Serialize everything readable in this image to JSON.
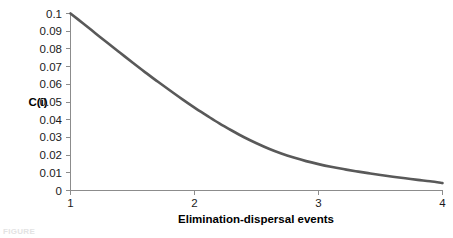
{
  "chart_data": {
    "type": "line",
    "title": "",
    "subtitle": "",
    "xlabel": "Elimination-dispersal events",
    "ylabel": "C(i)",
    "xlim": [
      1,
      4
    ],
    "ylim": [
      0,
      0.1
    ],
    "grid": false,
    "legend": null,
    "legend_position": "none",
    "xticks": [
      "1",
      "2",
      "3",
      "4"
    ],
    "xtick_values": [
      1,
      2,
      3,
      4
    ],
    "yticks": [
      "0",
      "0.01",
      "0.02",
      "0.03",
      "0.04",
      "0.05",
      "0.06",
      "0.07",
      "0.08",
      "0.09",
      "0.1"
    ],
    "ytick_values": [
      0,
      0.01,
      0.02,
      0.03,
      0.04,
      0.05,
      0.06,
      0.07,
      0.08,
      0.09,
      0.1
    ],
    "series": [
      {
        "name": "C(i)",
        "color": "#595959",
        "x": [
          1.0,
          1.1,
          1.2,
          1.3,
          1.4,
          1.5,
          1.6,
          1.7,
          1.8,
          1.9,
          2.0,
          2.1,
          2.2,
          2.3,
          2.4,
          2.5,
          2.6,
          2.7,
          2.8,
          2.9,
          3.0,
          3.1,
          3.2,
          3.3,
          3.4,
          3.5,
          3.6,
          3.7,
          3.8,
          3.9,
          4.0
        ],
        "values": [
          0.1,
          0.0945,
          0.0889,
          0.0833,
          0.0778,
          0.0723,
          0.0669,
          0.0617,
          0.0566,
          0.0516,
          0.0468,
          0.0423,
          0.0379,
          0.0339,
          0.0301,
          0.0267,
          0.0236,
          0.0209,
          0.0186,
          0.0166,
          0.0149,
          0.0134,
          0.0121,
          0.0109,
          0.0098,
          0.0088,
          0.0078,
          0.0069,
          0.006,
          0.0052,
          0.0042
        ]
      }
    ],
    "annotations": []
  },
  "axes": {
    "y_axis_label": "C(i)",
    "x_axis_label": "Elimination-dispersal events",
    "y_tick_labels": [
      "0.1",
      "0.09",
      "0.08",
      "0.07",
      "0.06",
      "0.05",
      "0.04",
      "0.03",
      "0.02",
      "0.01",
      "0"
    ],
    "x_tick_labels": [
      "1",
      "2",
      "3",
      "4"
    ]
  },
  "caption": {
    "remnant_text": "FIGURE"
  },
  "colors": {
    "curve": "#595959",
    "axis": "#8c8c8c",
    "text": "#1a1a1a",
    "background": "#ffffff"
  }
}
